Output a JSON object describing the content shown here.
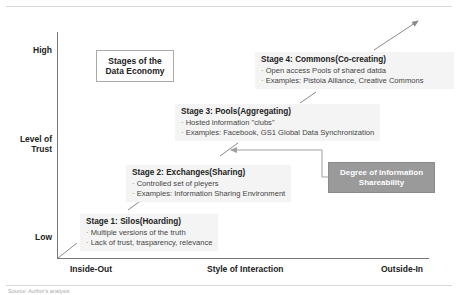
{
  "diagram": {
    "title": "Stages of the Data Economy",
    "y_axis": {
      "label": "Level of Trust",
      "high": "High",
      "low": "Low"
    },
    "x_axis": {
      "label": "Style of Interaction",
      "left": "Inside-Out",
      "right": "Outside-In"
    },
    "stages": [
      {
        "title": "Stage 1: Silos(Hoarding)",
        "bullets": [
          "Multiple versions of the truth",
          "Lack of trust, trasparency, relevance"
        ]
      },
      {
        "title": "Stage 2: Exchanges(Sharing)",
        "bullets": [
          "Controlled set of pleyers",
          "Examples: Information Sharing Environment"
        ]
      },
      {
        "title": "Stage 3: Pools(Aggregating)",
        "bullets": [
          "Hosted information \"clubs\"",
          "Examples: Facebook, GS1 Global Data Synchronization"
        ]
      },
      {
        "title": "Stage 4: Commons(Co-creating)",
        "bullets": [
          "Open access Pools of shared datda",
          "Examples: Pistoia Alliance, Creative Commons"
        ]
      }
    ],
    "callout": "Degree of Information Shareability",
    "caption": "Source: Author's analysis",
    "colors": {
      "axis": "#777777",
      "arrow": "#8a8a8a",
      "callout_bg": "#9a9a9a",
      "stage_bg": "#f4f4f4"
    }
  }
}
